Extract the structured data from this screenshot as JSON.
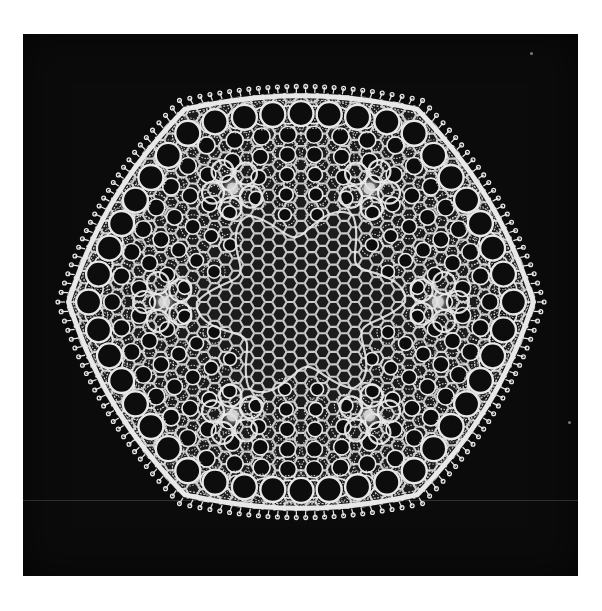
{
  "image": {
    "description": "Black-and-white photograph of a hexagonal needle-lace doily on a black background, framed by a white border",
    "background_color": "#0b0b0b",
    "border_color": "#ffffff",
    "lace_color": "#e8e8e8",
    "photo_frame": {
      "x": 23,
      "y": 34,
      "width": 555,
      "height": 542
    }
  },
  "doily": {
    "shape": "rounded-hexagon",
    "center": {
      "x": 301,
      "y": 302
    },
    "radius_x": 236,
    "radius_y": 226,
    "outer_loop_ring_count": 44,
    "inner_hole_rings": 4,
    "flower_motifs": 6,
    "center_mesh": "fine hexagonal net",
    "edge": "picot-scalloped border"
  },
  "artifacts": {
    "specks": [
      {
        "x": 568,
        "y": 421
      },
      {
        "x": 530,
        "y": 52
      }
    ],
    "scanline_y": 500
  }
}
